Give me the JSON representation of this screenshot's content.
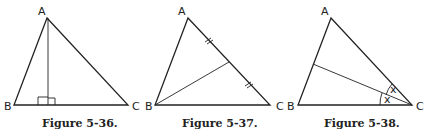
{
  "figures": [
    {
      "caption": "Figure 5-36.",
      "vertices": {
        "A": "A",
        "B": "B",
        "C": "C"
      },
      "construction": "altitude from A"
    },
    {
      "caption": "Figure 5-37.",
      "vertices": {
        "A": "A",
        "B": "B",
        "C": "C"
      },
      "construction": "median from B to AC"
    },
    {
      "caption": "Figure 5-38.",
      "vertices": {
        "A": "A",
        "B": "B",
        "C": "C"
      },
      "construction": "angle bisector from C",
      "angle_labels": [
        "x",
        "x"
      ]
    }
  ]
}
